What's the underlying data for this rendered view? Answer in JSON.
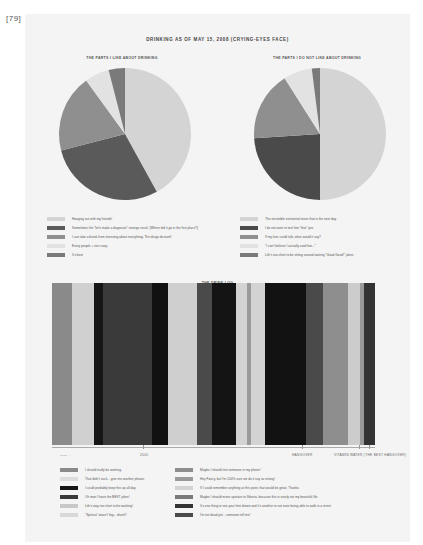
{
  "page_number": "[79]",
  "title": "DRINKING AS OF MAY 15, 2008 (CRYING-EYES FACE)",
  "chart_data": [
    {
      "type": "pie",
      "title": "THE PARTS I LIKE ABOUT DRINKING",
      "categories": [
        "Hanging out with my friends!",
        "Sometimes the \"let's make a diagnosis\" strange recoil. (Where did it go in the first place?)",
        "I can take a break from stressing about everything. The drugs do work!",
        "Every people + not crazy.",
        "It's best"
      ],
      "values": [
        42,
        29,
        19,
        6,
        4
      ],
      "colors": [
        "#d4d4d4",
        "#5a5a5a",
        "#8f8f8f",
        "#e2e2e2",
        "#7a7a7a"
      ]
    },
    {
      "type": "pie",
      "title": "THE PARTS I DO NOT LIKE ABOUT DRINKING",
      "categories": [
        "The inevitable existential mess that is the next day.",
        "I do not want to text him \"that\" yes.",
        "If my liver could talk, what would it say?",
        "\"I can't believe I actually said that...\"",
        "Life's too short to be sitting around waiting \"Good Good!\" jokes"
      ],
      "values": [
        50,
        24,
        17,
        7,
        2
      ],
      "colors": [
        "#d4d4d4",
        "#4a4a4a",
        "#8f8f8f",
        "#e2e2e2",
        "#7a7a7a"
      ]
    },
    {
      "type": "bar",
      "title": "THE DRINK LOG",
      "segments": [
        {
          "width": 20,
          "color": "#8a8a8a"
        },
        {
          "width": 22,
          "color": "#d0d0d0"
        },
        {
          "width": 9,
          "color": "#151515"
        },
        {
          "width": 49,
          "color": "#3a3a3a"
        },
        {
          "width": 16,
          "color": "#111111"
        },
        {
          "width": 29,
          "color": "#cfcfcf"
        },
        {
          "width": 15,
          "color": "#4a4a4a"
        },
        {
          "width": 25,
          "color": "#141414"
        },
        {
          "width": 11,
          "color": "#d3d3d3"
        },
        {
          "width": 4,
          "color": "#9a9a9a"
        },
        {
          "width": 14,
          "color": "#d3d3d3"
        },
        {
          "width": 41,
          "color": "#121212"
        },
        {
          "width": 17,
          "color": "#4a4a4a"
        },
        {
          "width": 25,
          "color": "#8e8e8e"
        },
        {
          "width": 12,
          "color": "#cccccc"
        },
        {
          "width": 4,
          "color": "#9a9a9a"
        },
        {
          "width": 11,
          "color": "#333333"
        }
      ],
      "axis_labels": [
        {
          "text": "——→",
          "x": 8
        },
        {
          "text": "2005",
          "x": 88
        },
        {
          "text": "HANGOVER",
          "x": 240
        },
        {
          "text": "VITAMIN WATER (THE BEST HANGOVER)",
          "x": 282
        }
      ],
      "ticks": [
        91,
        250,
        307,
        317
      ],
      "legend": [
        {
          "label": "I should really be working.",
          "color": "#8a8a8a"
        },
        {
          "label": "That didn't suck... give me another please.",
          "color": "#dcdcdc"
        },
        {
          "label": "I could probably keep this up all day.",
          "color": "#151515"
        },
        {
          "label": "Oh man I have the BEST jokes!",
          "color": "#3a3a3a"
        },
        {
          "label": "Life's way too short to be working!",
          "color": "#c8c8c8"
        },
        {
          "label": "\"Spiritus\" wasn't' big... drunk!!",
          "color": "#d8d8d8"
        },
        {
          "label": "Maybe I should text someone in my phone!",
          "color": "#8e8e8e"
        },
        {
          "label": "Hey Fancy, but I'm 100% sure we do it say so strong!",
          "color": "#9a9a9a"
        },
        {
          "label": "If I could remember anything at this point, that would be great. Thanks.",
          "color": "#d3d3d3"
        },
        {
          "label": "Maybe I should move upstairs to Siberia, because this is surely not my beautiful life.",
          "color": "#7a7a7a"
        },
        {
          "label": "It's one thing to see your feet drown and it's another to not even being able to walk in a street",
          "color": "#333333"
        },
        {
          "label": "I'm not dead yet... someone tell me!",
          "color": "#4a4a4a"
        }
      ]
    }
  ]
}
